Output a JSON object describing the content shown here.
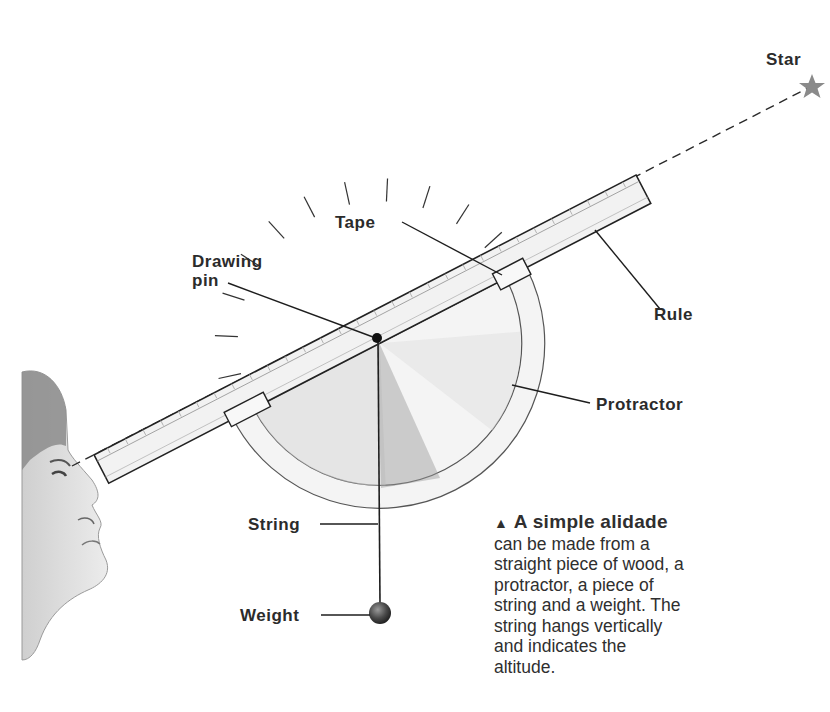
{
  "labels": {
    "star": "Star",
    "tape": "Tape",
    "drawing_pin_line1": "Drawing",
    "drawing_pin_line2": "pin",
    "rule": "Rule",
    "protractor": "Protractor",
    "string": "String",
    "weight": "Weight"
  },
  "caption": {
    "marker": "▲",
    "heading": "A simple alidade",
    "lines": [
      "can be made from a",
      "straight piece of wood, a",
      "protractor, a piece of",
      "string and a weight. The",
      "string hangs vertically",
      "and indicates the",
      "altitude."
    ]
  },
  "icons": {
    "star": "star-icon",
    "pin": "drawing-pin",
    "weight": "plumb-weight"
  },
  "colors": {
    "line": "#1e1e1e",
    "star": "#8a8a8a",
    "shade": "#bdbdbd",
    "rule_fill": "#f2f2f2"
  }
}
